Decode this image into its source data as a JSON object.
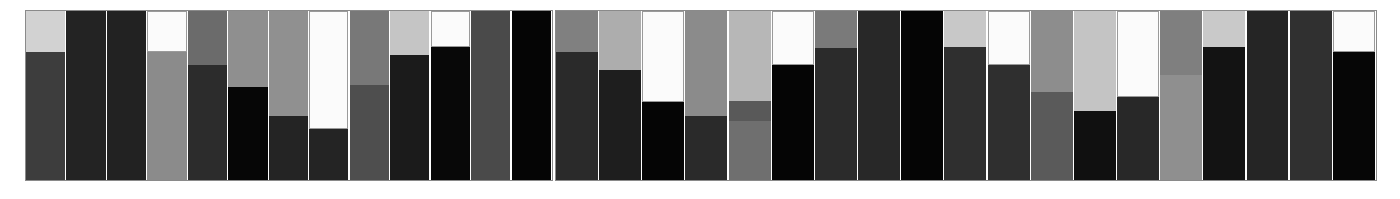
{
  "figure": {
    "background": "#ffffff",
    "panel_border_color": "#8a8a8a",
    "width": 1400,
    "height": 199
  },
  "chart_data": {
    "type": "bar",
    "title": "",
    "subtitle": "",
    "xlabel": "",
    "ylabel": "",
    "grid": false,
    "legend": false,
    "orientation": "vertical",
    "stacked": true,
    "ylim": [
      0,
      100
    ],
    "palette": {
      "white": "#fbfbfb",
      "light_gray": "#d0d0d0",
      "mid_light_gray": "#b4b4b4",
      "mid_gray": "#8f8f8f",
      "gray": "#6e6e6e",
      "dark_gray": "#4a4a4a",
      "darker_gray": "#333333",
      "near_black": "#1f1f1f",
      "black": "#050505"
    },
    "panels": [
      {
        "name": "panel-left",
        "x": 25,
        "y": 10,
        "width": 528,
        "height": 171,
        "bar_count": 12,
        "bars": [
          {
            "label": "L1",
            "segments": [
              {
                "color": "#3d3d3d",
                "value": 76
              },
              {
                "color": "#d2d2d2",
                "value": 24
              }
            ]
          },
          {
            "label": "L2",
            "segments": [
              {
                "color": "#232323",
                "value": 100
              }
            ]
          },
          {
            "label": "L3",
            "segments": [
              {
                "color": "#222222",
                "value": 100
              }
            ]
          },
          {
            "label": "L4",
            "segments": [
              {
                "color": "#8b8b8b",
                "value": 76
              },
              {
                "color": "#fbfbfb",
                "value": 24
              }
            ]
          },
          {
            "label": "L5",
            "segments": [
              {
                "color": "#2c2c2c",
                "value": 68
              },
              {
                "color": "#6b6b6b",
                "value": 32
              }
            ]
          },
          {
            "label": "L6",
            "segments": [
              {
                "color": "#060606",
                "value": 55
              },
              {
                "color": "#8f8f8f",
                "value": 45
              }
            ]
          },
          {
            "label": "L7",
            "segments": [
              {
                "color": "#242424",
                "value": 38
              },
              {
                "color": "#909090",
                "value": 62
              }
            ]
          },
          {
            "label": "L8",
            "segments": [
              {
                "color": "#242424",
                "value": 30
              },
              {
                "color": "#fbfbfb",
                "value": 70
              }
            ]
          },
          {
            "label": "L9",
            "segments": [
              {
                "color": "#4e4e4e",
                "value": 56
              },
              {
                "color": "#787878",
                "value": 44
              }
            ]
          },
          {
            "label": "L10",
            "segments": [
              {
                "color": "#1b1b1b",
                "value": 74
              },
              {
                "color": "#c5c5c5",
                "value": 26
              }
            ]
          },
          {
            "label": "L11",
            "segments": [
              {
                "color": "#080808",
                "value": 79
              },
              {
                "color": "#fbfbfb",
                "value": 21
              }
            ]
          },
          {
            "label": "L12",
            "segments": [
              {
                "color": "#4a4a4a",
                "value": 100
              }
            ]
          },
          {
            "label": "L13",
            "segments": [
              {
                "color": "#050505",
                "value": 100
              }
            ]
          }
        ]
      },
      {
        "name": "panel-right",
        "x": 555,
        "y": 10,
        "width": 822,
        "height": 171,
        "bar_count": 19,
        "bars": [
          {
            "label": "R1",
            "segments": [
              {
                "color": "#2a2a2a",
                "value": 76
              },
              {
                "color": "#808080",
                "value": 24
              }
            ]
          },
          {
            "label": "R2",
            "segments": [
              {
                "color": "#1e1e1e",
                "value": 65
              },
              {
                "color": "#adadad",
                "value": 35
              }
            ]
          },
          {
            "label": "R3",
            "segments": [
              {
                "color": "#050505",
                "value": 46
              },
              {
                "color": "#fbfbfb",
                "value": 54
              }
            ]
          },
          {
            "label": "R4",
            "segments": [
              {
                "color": "#2a2a2a",
                "value": 38
              },
              {
                "color": "#8b8b8b",
                "value": 62
              }
            ]
          },
          {
            "label": "R5",
            "segments": [
              {
                "color": "#6f6f6f",
                "value": 35
              },
              {
                "color": "#595959",
                "value": 12
              },
              {
                "color": "#b7b7b7",
                "value": 53
              }
            ]
          },
          {
            "label": "R6",
            "segments": [
              {
                "color": "#050505",
                "value": 68
              },
              {
                "color": "#fbfbfb",
                "value": 32
              }
            ]
          },
          {
            "label": "R7",
            "segments": [
              {
                "color": "#2b2b2b",
                "value": 78
              },
              {
                "color": "#7a7a7a",
                "value": 22
              }
            ]
          },
          {
            "label": "R8",
            "segments": [
              {
                "color": "#282828",
                "value": 100
              }
            ]
          },
          {
            "label": "R9",
            "segments": [
              {
                "color": "#050505",
                "value": 100
              }
            ]
          },
          {
            "label": "R10",
            "segments": [
              {
                "color": "#2f2f2f",
                "value": 79
              },
              {
                "color": "#c8c8c8",
                "value": 21
              }
            ]
          },
          {
            "label": "R11",
            "segments": [
              {
                "color": "#2f2f2f",
                "value": 68
              },
              {
                "color": "#fbfbfb",
                "value": 32
              }
            ]
          },
          {
            "label": "R12",
            "segments": [
              {
                "color": "#5a5a5a",
                "value": 52
              },
              {
                "color": "#8d8d8d",
                "value": 48
              }
            ]
          },
          {
            "label": "R13",
            "segments": [
              {
                "color": "#101010",
                "value": 41
              },
              {
                "color": "#c4c4c4",
                "value": 59
              }
            ]
          },
          {
            "label": "R14",
            "segments": [
              {
                "color": "#282828",
                "value": 49
              },
              {
                "color": "#fbfbfb",
                "value": 51
              }
            ]
          },
          {
            "label": "R15",
            "segments": [
              {
                "color": "#8f8f8f",
                "value": 62
              },
              {
                "color": "#7f7f7f",
                "value": 38
              }
            ]
          },
          {
            "label": "R16",
            "segments": [
              {
                "color": "#131313",
                "value": 79
              },
              {
                "color": "#c9c9c9",
                "value": 21
              }
            ]
          },
          {
            "label": "R17",
            "segments": [
              {
                "color": "#252525",
                "value": 100
              }
            ]
          },
          {
            "label": "R18",
            "segments": [
              {
                "color": "#303030",
                "value": 100
              }
            ]
          },
          {
            "label": "R19",
            "segments": [
              {
                "color": "#060606",
                "value": 76
              },
              {
                "color": "#fbfbfb",
                "value": 24
              }
            ]
          }
        ]
      }
    ]
  }
}
